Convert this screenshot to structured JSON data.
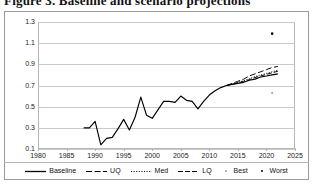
{
  "title": "Figure 3. Baseline and scenario projections",
  "chart_data": {
    "type": "line",
    "title": "Figure 3. Baseline and scenario projections",
    "xlabel": "",
    "ylabel": "",
    "xlim": [
      1980,
      2025
    ],
    "ylim": [
      0.1,
      1.3
    ],
    "grid": true,
    "legend_position": "bottom",
    "x_ticks": [
      "1980",
      "1985",
      "1990",
      "1995",
      "2000",
      "2005",
      "2010",
      "2015",
      "2020",
      "2025"
    ],
    "y_ticks": [
      "0.1",
      "0.3",
      "0.5",
      "0.7",
      "0.9",
      "1.1",
      "1.3"
    ],
    "series": [
      {
        "name": "Baseline",
        "style": "solid",
        "color": "#000000",
        "x": [
          1988,
          1989,
          1990,
          1991,
          1992,
          1993,
          1994,
          1995,
          1996,
          1997,
          1998,
          1999,
          2000,
          2001,
          2002,
          2003,
          2004,
          2005,
          2006,
          2007,
          2008,
          2009,
          2010,
          2011,
          2012,
          2013,
          2014,
          2015,
          2016,
          2017,
          2018,
          2019,
          2020,
          2021,
          2022
        ],
        "values": [
          0.3,
          0.3,
          0.36,
          0.14,
          0.2,
          0.21,
          0.29,
          0.38,
          0.28,
          0.4,
          0.59,
          0.42,
          0.39,
          0.47,
          0.55,
          0.55,
          0.54,
          0.6,
          0.56,
          0.55,
          0.48,
          0.55,
          0.61,
          0.65,
          0.68,
          0.7,
          0.71,
          0.72,
          0.73,
          0.75,
          0.76,
          0.78,
          0.79,
          0.8,
          0.81
        ]
      },
      {
        "name": "UQ",
        "style": "long-dash",
        "color": "#000000",
        "x": [
          2013,
          2014,
          2015,
          2016,
          2017,
          2018,
          2019,
          2020,
          2021,
          2022
        ],
        "values": [
          0.7,
          0.72,
          0.74,
          0.76,
          0.79,
          0.81,
          0.83,
          0.85,
          0.87,
          0.88
        ]
      },
      {
        "name": "Med",
        "style": "dotted",
        "color": "#000000",
        "x": [
          2013,
          2014,
          2015,
          2016,
          2017,
          2018,
          2019,
          2020,
          2021,
          2022
        ],
        "values": [
          0.7,
          0.715,
          0.73,
          0.745,
          0.765,
          0.785,
          0.8,
          0.815,
          0.83,
          0.845
        ]
      },
      {
        "name": "LQ",
        "style": "dash-dash",
        "color": "#000000",
        "x": [
          2013,
          2014,
          2015,
          2016,
          2017,
          2018,
          2019,
          2020,
          2021,
          2022
        ],
        "values": [
          0.7,
          0.712,
          0.725,
          0.74,
          0.755,
          0.775,
          0.79,
          0.805,
          0.82,
          0.835
        ]
      },
      {
        "name": "Best",
        "style": "marker-dot-light",
        "color": "#9a9a9a",
        "x": [
          2021
        ],
        "values": [
          0.63
        ]
      },
      {
        "name": "Worst",
        "style": "marker-dot-dark",
        "color": "#000000",
        "x": [
          2021
        ],
        "values": [
          1.19
        ]
      }
    ],
    "legend": [
      {
        "label": "Baseline",
        "style": "solid"
      },
      {
        "label": "UQ",
        "style": "long-dash"
      },
      {
        "label": "Med",
        "style": "dotted"
      },
      {
        "label": "LQ",
        "style": "dash-dash"
      },
      {
        "label": "Best",
        "style": "marker-dot-light"
      },
      {
        "label": "Worst",
        "style": "marker-dot-dark"
      }
    ]
  },
  "colors": {
    "line": "#000000",
    "grid": "#c9c9c9",
    "frame": "#b6b6b6",
    "outer_frame": "#9a9a9a",
    "best_marker": "#9a9a9a",
    "worst_marker": "#000000"
  }
}
